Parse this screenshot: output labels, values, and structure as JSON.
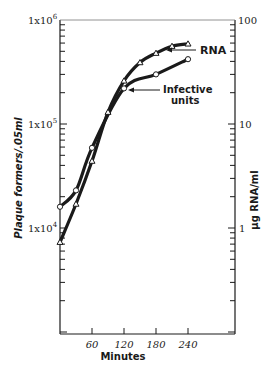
{
  "chart_data": {
    "type": "line",
    "title": "",
    "xlabel": "Minutes",
    "ylabel_left": "Plaque formers/.05ml",
    "ylabel_right": "µg RNA/ml",
    "x_ticks": [
      "60",
      "120",
      "180",
      "240"
    ],
    "x_range": [
      0,
      330
    ],
    "y_left_ticks": [
      "1x10^4",
      "1x10^5",
      "1x10^6"
    ],
    "y_left_scale": "log",
    "y_left_range": [
      2000,
      1000000
    ],
    "y_right_ticks": [
      "1",
      "10",
      "100"
    ],
    "y_right_scale": "log",
    "y_right_range": [
      0.2,
      100
    ],
    "grid": false,
    "series": [
      {
        "name": "Infective units",
        "axis": "left",
        "marker": "circle",
        "x": [
          0,
          30,
          60,
          120,
          180,
          240
        ],
        "values": [
          16000,
          23000,
          59000,
          220000,
          300000,
          420000
        ]
      },
      {
        "name": "RNA",
        "axis": "right",
        "marker": "triangle",
        "x": [
          0,
          30,
          60,
          90,
          120,
          150,
          180,
          210,
          240
        ],
        "values": [
          0.73,
          1.7,
          4.4,
          13,
          26,
          39,
          48,
          56,
          59
        ]
      }
    ],
    "annotations": [
      "RNA",
      "Infective units"
    ]
  },
  "labels": {
    "xlabel": "Minutes",
    "ylabel_left": "Plaque formers/.05ml",
    "ylabel_right": "µg RNA/ml",
    "annot_rna": "RNA",
    "annot_inf_1": "Infective",
    "annot_inf_2": "units",
    "x60": "60",
    "x120": "120",
    "x180": "180",
    "x240": "240",
    "yl6_base": "1x10",
    "yl6_exp": "6",
    "yl5_base": "1x10",
    "yl5_exp": "5",
    "yl4_base": "1x10",
    "yl4_exp": "4",
    "yr100": "100",
    "yr10": "10",
    "yr1": "1"
  }
}
